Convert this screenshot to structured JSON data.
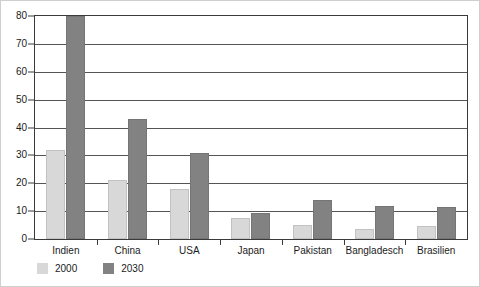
{
  "chart_data": {
    "type": "bar",
    "title": "",
    "subtitle": "",
    "xlabel": "",
    "ylabel": "",
    "ylim": [
      0,
      80
    ],
    "yticks": [
      0,
      10,
      20,
      30,
      40,
      50,
      60,
      70,
      80
    ],
    "ytick_labels": [
      "0",
      "10",
      "20",
      "30",
      "40",
      "50",
      "60",
      "70",
      "80"
    ],
    "grid": true,
    "legend_position": "bottom-left",
    "categories": [
      "Indien",
      "China",
      "USA",
      "Japan",
      "Pakistan",
      "Bangladesch",
      "Brasilien"
    ],
    "series": [
      {
        "name": "2000",
        "color": "#d8d8d8",
        "values": [
          32,
          21,
          18,
          7.5,
          5,
          3.5,
          4.5
        ]
      },
      {
        "name": "2030",
        "color": "#828282",
        "values": [
          80,
          43,
          31,
          9.5,
          14,
          12,
          11.5
        ]
      }
    ]
  },
  "legend": {
    "items": [
      {
        "label": "2000",
        "color": "#d8d8d8"
      },
      {
        "label": "2030",
        "color": "#828282"
      }
    ]
  }
}
